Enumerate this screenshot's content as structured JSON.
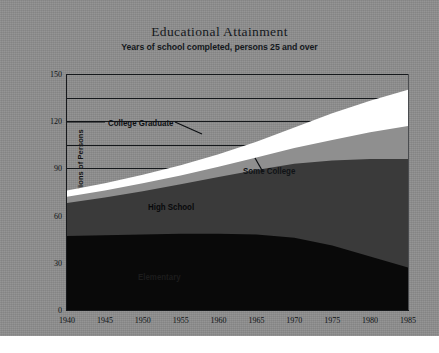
{
  "chart_data": {
    "type": "area",
    "title": "Educational Attainment",
    "subtitle": "Years of school completed, persons 25 and over",
    "xlabel": "",
    "ylabel": "Millions of Persons",
    "xlim": [
      1940,
      1985
    ],
    "ylim": [
      0,
      150
    ],
    "grid": true,
    "legend_position": "inline-annotations",
    "stacked": true,
    "y_ticks": [
      0,
      30,
      60,
      90,
      120,
      150
    ],
    "y_gridlines": [
      90,
      105,
      120,
      135,
      150
    ],
    "x_ticks": [
      1940,
      1945,
      1950,
      1955,
      1960,
      1965,
      1970,
      1975,
      1980,
      1985
    ],
    "x": [
      1940,
      1945,
      1950,
      1955,
      1960,
      1965,
      1970,
      1975,
      1980,
      1985
    ],
    "series": [
      {
        "name": "Elementary",
        "color": "#090909",
        "values": [
          47.0,
          47.5,
          48.0,
          48.5,
          48.5,
          48.0,
          46.0,
          41.0,
          34.0,
          27.0
        ]
      },
      {
        "name": "High School",
        "color": "#3a3a3a",
        "values": [
          21.0,
          24.0,
          27.5,
          31.5,
          36.0,
          41.0,
          47.0,
          54.0,
          62.0,
          69.0
        ]
      },
      {
        "name": "Some College",
        "color": "#8f8f8f",
        "values": [
          4.0,
          4.5,
          5.0,
          5.5,
          6.5,
          8.0,
          10.0,
          13.0,
          17.0,
          21.0
        ]
      },
      {
        "name": "College Graduate",
        "color": "#ffffff",
        "values": [
          4.0,
          4.5,
          5.5,
          6.5,
          8.0,
          10.0,
          13.0,
          17.0,
          20.0,
          23.0
        ]
      }
    ],
    "totals": [
      76.0,
      80.5,
      86.0,
      92.0,
      99.0,
      107.0,
      116.0,
      125.0,
      133.0,
      140.0
    ],
    "annotations": [
      {
        "name": "college-graduate",
        "text": "College Graduate"
      },
      {
        "name": "some-college",
        "text": "Some College"
      },
      {
        "name": "high-school",
        "text": "High School"
      },
      {
        "name": "elementary",
        "text": "Elementary"
      }
    ]
  },
  "colors": {
    "background": "#8d8d8d",
    "axis": "#17191c",
    "elementary": "#090909",
    "high_school": "#3a3a3a",
    "some_college": "#8f8f8f",
    "college_graduate": "#ffffff"
  }
}
